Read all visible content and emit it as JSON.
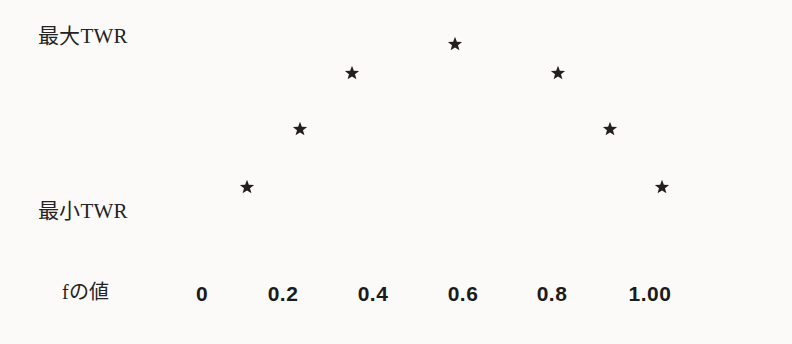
{
  "figure": {
    "background_color": "#fbfaf8",
    "marker_color": "#241f1c",
    "text_color": "#232323",
    "y_axis": {
      "top_label": "最大TWR",
      "bottom_label": "最小TWR"
    },
    "x_axis": {
      "label": "fの値",
      "tick_labels": [
        "0",
        "0.2",
        "0.4",
        "0.6",
        "0.8",
        "1.00"
      ],
      "tick_x_px": [
        202,
        283,
        373,
        463,
        552,
        650
      ]
    },
    "markers": [
      {
        "name": "data-point-f-0.1",
        "x_px": 247,
        "y_px": 187
      },
      {
        "name": "data-point-f-0.2",
        "x_px": 300,
        "y_px": 129
      },
      {
        "name": "data-point-f-0.3",
        "x_px": 352,
        "y_px": 73
      },
      {
        "name": "data-point-f-0.5",
        "x_px": 455,
        "y_px": 44
      },
      {
        "name": "data-point-f-0.7",
        "x_px": 558,
        "y_px": 73
      },
      {
        "name": "data-point-f-0.8",
        "x_px": 610,
        "y_px": 129
      },
      {
        "name": "data-point-f-0.9",
        "x_px": 662,
        "y_px": 187
      }
    ]
  },
  "chart_data": {
    "type": "scatter",
    "title": "",
    "xlabel": "fの値",
    "ylabel": "",
    "x": [
      0.1,
      0.2,
      0.3,
      0.5,
      0.7,
      0.8,
      0.9
    ],
    "y": [
      0.16,
      0.5,
      0.83,
      1.0,
      0.83,
      0.5,
      0.16
    ],
    "series": [
      {
        "name": "TWR",
        "x": [
          0.1,
          0.2,
          0.3,
          0.5,
          0.7,
          0.8,
          0.9
        ],
        "y": [
          0.16,
          0.5,
          0.83,
          1.0,
          0.83,
          0.5,
          0.16
        ]
      }
    ],
    "xlim": [
      -0.02,
      1.05
    ],
    "ylim": [
      0,
      1.06
    ],
    "xticks": [
      0,
      0.2,
      0.4,
      0.6,
      0.8,
      1.0
    ],
    "xticklabels": [
      "0",
      "0.2",
      "0.4",
      "0.6",
      "0.8",
      "1.00"
    ],
    "yticks": [
      0.16,
      1.0
    ],
    "yticklabels": [
      "最小TWR",
      "最大TWR"
    ],
    "grid": false,
    "legend": false,
    "marker": "star",
    "annotations": []
  }
}
